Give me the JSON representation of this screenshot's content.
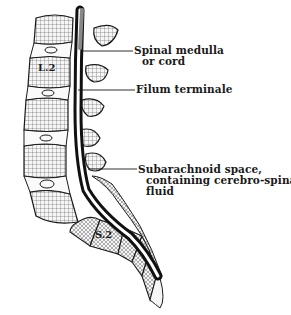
{
  "figure": {
    "type": "anatomical sagittal section of lumbar and sacral spine",
    "colors": {
      "ink": "#1a1a1a",
      "background": "#ffffff",
      "bone_fill": "#f4f4f4"
    }
  },
  "labels": {
    "spinal_cord_line1": "Spinal medulla",
    "spinal_cord_line2": "or cord",
    "filum": "Filum terminale",
    "subarachnoid_line1": "Subarachnoid space,",
    "subarachnoid_line2": "containing cerebro-spinal",
    "subarachnoid_line3": "fluid"
  },
  "vertebra_labels": {
    "lumbar": "L.2",
    "sacral": "S.2"
  }
}
